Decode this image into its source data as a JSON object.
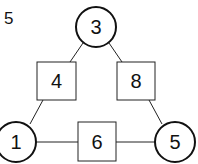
{
  "problem_number": "5",
  "circles": [
    {
      "id": "top",
      "value": "3"
    },
    {
      "id": "bottom-left",
      "value": "1"
    },
    {
      "id": "bottom-right",
      "value": "5"
    }
  ],
  "boxes": [
    {
      "id": "left-edge",
      "value": "4"
    },
    {
      "id": "right-edge",
      "value": "8"
    },
    {
      "id": "bottom-edge",
      "value": "6"
    }
  ],
  "colors": {
    "stroke": "#111111",
    "background": "#ffffff"
  }
}
